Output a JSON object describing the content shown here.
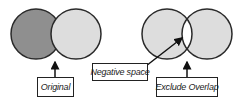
{
  "colors": {
    "dark_fill": "#8f8f8f",
    "light_fill": "#dddddd",
    "stroke": "#2a2a2a",
    "background": "#ffffff"
  },
  "diagram": {
    "left_group": {
      "shapes": [
        "dark-circle",
        "light-circle-overlapping"
      ],
      "label": "Original"
    },
    "right_group": {
      "shapes": [
        "light-circle",
        "light-circle"
      ],
      "overlap": "white (excluded)",
      "labels": {
        "negative_space": "Negative space",
        "exclude_overlap": "Exclude Overlap"
      }
    }
  }
}
